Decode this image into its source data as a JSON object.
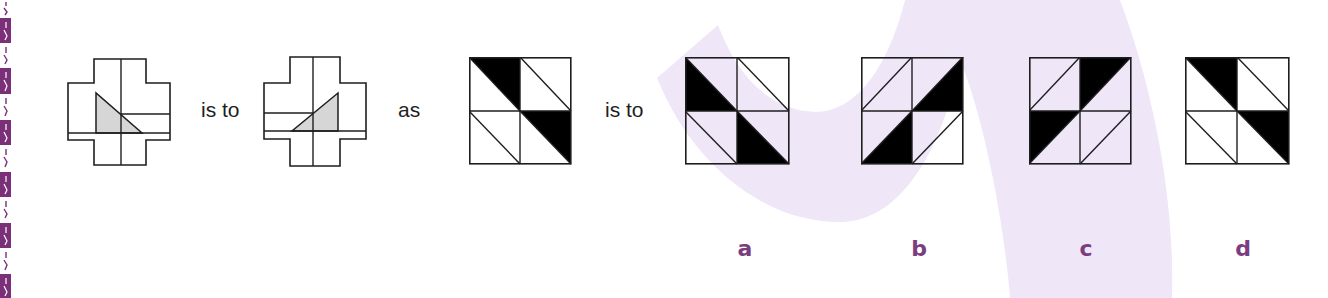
{
  "colors": {
    "label_purple": "#7b3d7f",
    "watermark_lavender": "#efe6f8",
    "strip_purple": "#7a2f78",
    "figure_gray": "#d6d6d6",
    "ink": "#1e1e1e"
  },
  "question": {
    "connectors": {
      "is_to_1": "is to",
      "as": "as",
      "is_to_2": "is to"
    },
    "figures": [
      {
        "id": "cross-1",
        "shape": "cross",
        "triangle": "left-vertical-leg, hypotenuse descending to right, gray fill",
        "extra_line": "right half at mid-arm"
      },
      {
        "id": "cross-2",
        "shape": "cross",
        "triangle": "right-vertical-leg, hypotenuse ascending to right, gray fill",
        "extra_line": "left half at mid-arm"
      },
      {
        "id": "grid-3",
        "shape": "2x2-grid",
        "diagonals": "tl-br",
        "black_cells": [
          "top-left: upper-right half",
          "bottom-right: upper-right half"
        ]
      }
    ]
  },
  "options": [
    {
      "label": "a",
      "diagonals": "tl-br",
      "black_cells": [
        "top-left: lower-left half",
        "bottom-right: lower-left half"
      ]
    },
    {
      "label": "b",
      "diagonals": "bl-tr",
      "black_cells": [
        "top-right: lower-right half",
        "bottom-left: lower-right half"
      ]
    },
    {
      "label": "c",
      "diagonals": "bl-tr",
      "black_cells": [
        "top-right: upper-left half",
        "bottom-left: upper-left half"
      ]
    },
    {
      "label": "d",
      "diagonals": "tl-br",
      "black_cells": [
        "top-left: upper-right half",
        "bottom-right: upper-right half"
      ]
    }
  ]
}
